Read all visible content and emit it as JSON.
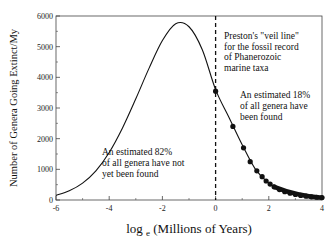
{
  "chart_data": {
    "type": "line",
    "title": "",
    "xlabel": "log",
    "xlabel_subscript": "e",
    "xlabel_suffix": "(Millions of Years)",
    "ylabel": "Number of Genera Going Extinct/My",
    "xlim": [
      -6,
      4
    ],
    "ylim": [
      0,
      6000
    ],
    "x_ticks": [
      "-6",
      "-4",
      "-2",
      "0",
      "2",
      "4"
    ],
    "y_ticks": [
      "0",
      "1000",
      "2000",
      "3000",
      "4000",
      "5000",
      "6000"
    ],
    "grid": false,
    "series": [
      {
        "name": "lognormal extinction curve",
        "style": "line",
        "x": [
          -6,
          -5.5,
          -5,
          -4.5,
          -4,
          -3.5,
          -3,
          -2.5,
          -2,
          -1.5,
          -1,
          -0.5,
          0,
          0.5,
          1,
          1.5,
          2,
          2.5,
          3,
          3.5,
          4
        ],
        "y": [
          150,
          300,
          550,
          950,
          1550,
          2350,
          3300,
          4300,
          5200,
          5750,
          5650,
          4900,
          3600,
          2700,
          1800,
          1000,
          550,
          300,
          170,
          110,
          80
        ]
      },
      {
        "name": "observed genera (fossil record)",
        "style": "points",
        "x": [
          0,
          0.65,
          1.05,
          1.3,
          1.55,
          1.75,
          1.9,
          2.05,
          2.2,
          2.4,
          2.6,
          2.8,
          3.0,
          3.2,
          3.4,
          3.6,
          3.8,
          4.0
        ],
        "y": [
          3550,
          2400,
          1700,
          1250,
          950,
          760,
          620,
          520,
          430,
          340,
          270,
          220,
          180,
          150,
          125,
          105,
          90,
          80
        ]
      }
    ],
    "veil_line": {
      "x": 0,
      "style": "dashed"
    },
    "annotations": [
      {
        "id": "veil",
        "lines": [
          "Preston's \"veil line\"",
          "for the fossil record",
          "of Phanerozoic",
          "marine taxa"
        ]
      },
      {
        "id": "found",
        "lines": [
          "An estimated 18%",
          "of all genera have",
          "been found"
        ]
      },
      {
        "id": "notfound",
        "lines": [
          "An estimated 82%",
          "of all genera have not",
          "yet been found"
        ]
      }
    ]
  }
}
